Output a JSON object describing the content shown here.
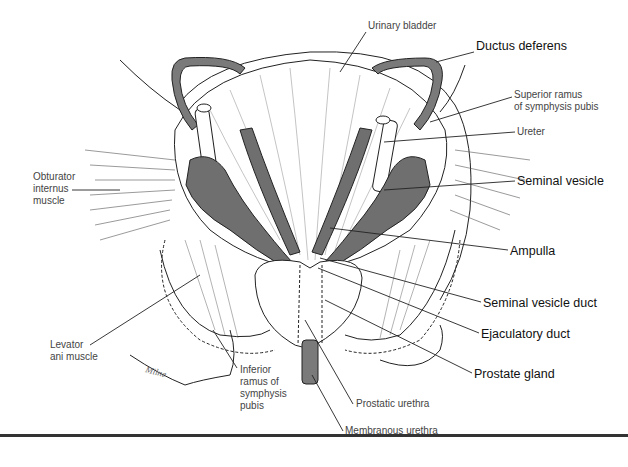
{
  "figure": {
    "type": "anatomical illustration",
    "colors": {
      "line": "#222222",
      "duct_fill": "#7a7a7a",
      "vesicle_fill": "#6f6f6f",
      "background": "#ffffff",
      "rule": "#333333"
    },
    "labels": [
      {
        "id": "urinary-bladder",
        "text": "Urinary bladder",
        "bold": false,
        "x": 368,
        "y": 26
      },
      {
        "id": "ductus-deferens",
        "text": "Ductus deferens",
        "bold": true,
        "x": 476,
        "y": 46
      },
      {
        "id": "superior-ramus",
        "text": "Superior ramus\nof symphysis pubis",
        "bold": false,
        "x": 514,
        "y": 89
      },
      {
        "id": "ureter",
        "text": "Ureter",
        "bold": false,
        "x": 517,
        "y": 126
      },
      {
        "id": "seminal-vesicle",
        "text": "Seminal vesicle",
        "bold": true,
        "x": 517,
        "y": 174
      },
      {
        "id": "ampulla",
        "text": "Ampulla",
        "bold": true,
        "x": 510,
        "y": 244
      },
      {
        "id": "seminal-vesicle-duct",
        "text": "Seminal vesicle duct",
        "bold": true,
        "x": 483,
        "y": 296
      },
      {
        "id": "ejaculatory-duct",
        "text": "Ejaculatory duct",
        "bold": true,
        "x": 481,
        "y": 327
      },
      {
        "id": "prostate-gland",
        "text": "Prostate gland",
        "bold": true,
        "x": 474,
        "y": 367
      },
      {
        "id": "prostatic-urethra",
        "text": "Prostatic urethra",
        "bold": false,
        "x": 356,
        "y": 398
      },
      {
        "id": "membranous-urethra",
        "text": "Membranous urethra",
        "bold": false,
        "x": 345,
        "y": 425
      },
      {
        "id": "obturator-internus",
        "text": "Obturator\ninternus\nmuscle",
        "bold": false,
        "x": 33,
        "y": 171
      },
      {
        "id": "levator-ani",
        "text": "Levator\nani muscle",
        "bold": false,
        "x": 50,
        "y": 339
      },
      {
        "id": "inferior-ramus",
        "text": "Inferior\nramus of\nsymphysis\npubis",
        "bold": false,
        "x": 240,
        "y": 364
      }
    ],
    "signature": "Milne"
  }
}
